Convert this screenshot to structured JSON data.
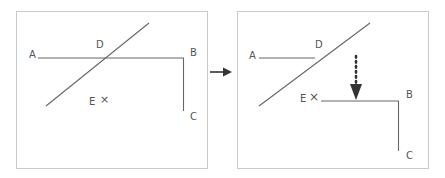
{
  "figure": {
    "type": "geometry-diagram",
    "background_color": "#ffffff",
    "line_color": "#666666",
    "label_color": "#555555",
    "panel_border_color": "#c9c9c9",
    "arrow_color": "#333333"
  },
  "transition": {
    "icon": "right-arrow-icon",
    "direction": "right"
  },
  "panels": [
    {
      "id": "before",
      "name": "before-panel",
      "labels": [
        {
          "id": "A",
          "text": "A",
          "x": 12,
          "y": 38
        },
        {
          "id": "D",
          "text": "D",
          "x": 79,
          "y": 28
        },
        {
          "id": "B",
          "text": "B",
          "x": 173,
          "y": 36
        },
        {
          "id": "C",
          "text": "C",
          "x": 173,
          "y": 100
        },
        {
          "id": "E",
          "text": "E",
          "x": 72,
          "y": 85
        }
      ],
      "x_mark": {
        "id": "E-cross",
        "text": "×",
        "x": 83,
        "y": 84
      },
      "segments": [
        {
          "name": "horizontal-AB",
          "x1": 21,
          "y1": 46,
          "x2": 167,
          "y2": 46
        },
        {
          "name": "vertical-BC",
          "x1": 167,
          "y1": 46,
          "x2": 167,
          "y2": 99
        },
        {
          "name": "diagonal-transversal",
          "x1": 29,
          "y1": 94,
          "x2": 132,
          "y2": 11
        }
      ]
    },
    {
      "id": "after",
      "name": "after-panel",
      "labels": [
        {
          "id": "A",
          "text": "A",
          "x": 11,
          "y": 39
        },
        {
          "id": "D",
          "text": "D",
          "x": 77,
          "y": 28
        },
        {
          "id": "B",
          "text": "B",
          "x": 168,
          "y": 78
        },
        {
          "id": "C",
          "text": "C",
          "x": 168,
          "y": 139
        },
        {
          "id": "E",
          "text": "E",
          "x": 62,
          "y": 82
        }
      ],
      "x_mark": {
        "id": "E-cross",
        "text": "×",
        "x": 72,
        "y": 81
      },
      "segments": [
        {
          "name": "horizontal-AD",
          "x1": 21,
          "y1": 46,
          "x2": 76,
          "y2": 46
        },
        {
          "name": "horizontal-EB",
          "x1": 83,
          "y1": 89,
          "x2": 161,
          "y2": 89
        },
        {
          "name": "vertical-BC",
          "x1": 161,
          "y1": 89,
          "x2": 161,
          "y2": 139
        },
        {
          "name": "diagonal-transversal",
          "x1": 21,
          "y1": 94,
          "x2": 132,
          "y2": 11
        }
      ],
      "motion_arrow": {
        "name": "translation-arrow",
        "style": "dotted",
        "x": 118,
        "y_start": 44,
        "y_end": 88,
        "direction": "down"
      }
    }
  ]
}
